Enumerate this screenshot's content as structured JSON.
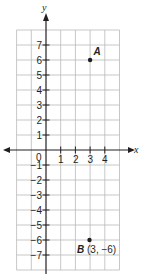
{
  "figure": {
    "type": "coordinate-plane",
    "x_axis": {
      "label": "x",
      "tick_labels": [
        "0",
        "1",
        "2",
        "3",
        "4"
      ]
    },
    "y_axis": {
      "label": "y",
      "tick_labels": [
        "7",
        "6",
        "5",
        "4",
        "3",
        "2",
        "1",
        "−1",
        "−2",
        "−3",
        "−4",
        "−5",
        "−6",
        "−7"
      ]
    },
    "grid": {
      "x_min": -2,
      "x_max": 5,
      "y_min": -8,
      "y_max": 8
    },
    "points": [
      {
        "name": "A",
        "x": 3,
        "y": 6,
        "coord_label": ""
      },
      {
        "name": "B",
        "x": 3,
        "y": -6,
        "coord_label": "(3, −6)"
      }
    ],
    "colors": {
      "ink": "#231f20",
      "grid": "#b9b9b9"
    }
  }
}
